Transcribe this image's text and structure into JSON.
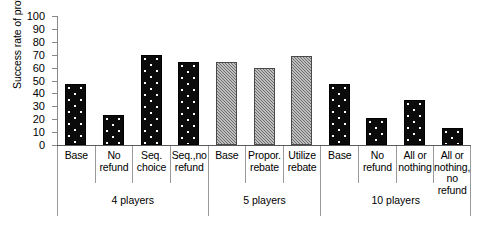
{
  "chart_data": {
    "type": "bar",
    "title": "",
    "subtitle": "",
    "xlabel": "",
    "ylabel": "Success rate of provision (%)",
    "ylim": [
      0,
      100
    ],
    "ytick_labels": [
      "100",
      "90",
      "80",
      "70",
      "60",
      "50",
      "40",
      "30",
      "20",
      "10",
      "0"
    ],
    "ytick_values": [
      100,
      90,
      80,
      70,
      60,
      50,
      40,
      30,
      20,
      10,
      0
    ],
    "grid": false,
    "legend": "none",
    "categories": [
      "Base",
      "No refund",
      "Seq. choice",
      "Seq.,no refund",
      "Base",
      "Propor. rebate",
      "Utilize rebate",
      "Base",
      "No refund",
      "All or nothing",
      "All or nothing, no refund"
    ],
    "values": [
      47,
      23,
      70,
      64,
      64,
      60,
      69,
      47,
      21,
      35,
      13
    ],
    "groups": [
      {
        "label": "4 players",
        "fill": "black-dotted",
        "bars": [
          {
            "label": "Base",
            "label_lines": "Base",
            "value": 47
          },
          {
            "label": "No refund",
            "label_lines": "No\nrefund",
            "value": 23
          },
          {
            "label": "Seq. choice",
            "label_lines": "Seq.\nchoice",
            "value": 70
          },
          {
            "label": "Seq.,no refund",
            "label_lines": "Seq.,no\nrefund",
            "value": 64
          }
        ]
      },
      {
        "label": "5 players",
        "fill": "gray-hatched",
        "bars": [
          {
            "label": "Base",
            "label_lines": "Base",
            "value": 64
          },
          {
            "label": "Propor. rebate",
            "label_lines": "Propor.\nrebate",
            "value": 60
          },
          {
            "label": "Utilize rebate",
            "label_lines": "Utilize\nrebate",
            "value": 69
          }
        ]
      },
      {
        "label": "10 players",
        "fill": "black-dotted",
        "bars": [
          {
            "label": "Base",
            "label_lines": "Base",
            "value": 47
          },
          {
            "label": "No refund",
            "label_lines": "No\nrefund",
            "value": 21
          },
          {
            "label": "All or nothing",
            "label_lines": "All or\nnothing",
            "value": 35
          },
          {
            "label": "All or nothing, no refund",
            "label_lines": "All or\nnothing,\nno\nrefund",
            "value": 13
          }
        ]
      }
    ],
    "colors": {
      "bar_black": "#0b0b0b",
      "bar_gray": "#6e6e6e",
      "axis": "#8a8a8a",
      "text": "#000000",
      "background": "#ffffff"
    }
  }
}
